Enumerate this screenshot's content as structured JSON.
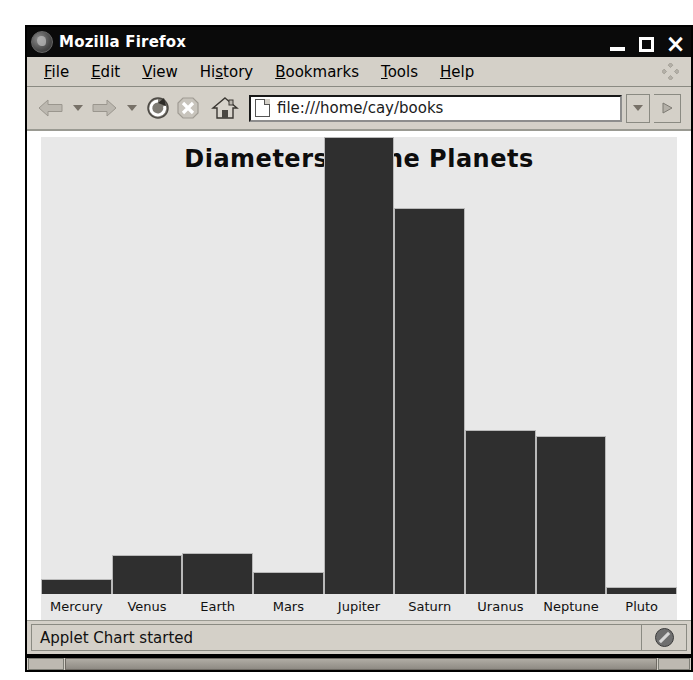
{
  "window": {
    "title": "Mozilla Firefox",
    "logo_icon": "firefox-logo-icon",
    "controls": {
      "minimize_label": "_",
      "maximize_label": "□",
      "close_label": "×"
    }
  },
  "menubar": {
    "items": [
      {
        "name": "file",
        "pre": "",
        "mnemonic": "F",
        "post": "ile"
      },
      {
        "name": "edit",
        "pre": "",
        "mnemonic": "E",
        "post": "dit"
      },
      {
        "name": "view",
        "pre": "",
        "mnemonic": "V",
        "post": "iew"
      },
      {
        "name": "history",
        "pre": "Hi",
        "mnemonic": "s",
        "post": "tory"
      },
      {
        "name": "bookmarks",
        "pre": "",
        "mnemonic": "B",
        "post": "ookmarks"
      },
      {
        "name": "tools",
        "pre": "",
        "mnemonic": "T",
        "post": "ools"
      },
      {
        "name": "help",
        "pre": "",
        "mnemonic": "H",
        "post": "elp"
      }
    ],
    "throbber_icon": "throbber-icon"
  },
  "toolbar": {
    "back_icon": "back-arrow-icon",
    "forward_icon": "forward-arrow-icon",
    "reload_icon": "reload-icon",
    "stop_icon": "stop-icon",
    "home_icon": "home-icon",
    "page_icon": "page-document-icon",
    "url_value": "file:///home/cay/books",
    "url_placeholder": "",
    "dropdown_icon": "chevron-down-icon",
    "go_icon": "go-arrow-icon"
  },
  "statusbar": {
    "message": "Applet Chart started",
    "security_icon": "security-slash-icon"
  },
  "colors": {
    "title_bar": "#0a0a0a",
    "chrome": "#d4d0c8",
    "chart_background": "#e8e8e8",
    "bar_fill": "#2f2f2f",
    "bar_border": "#b9b9b9",
    "text": "#111111"
  },
  "chart_data": {
    "type": "bar",
    "title": "Diameters of the Planets",
    "xlabel": "",
    "ylabel": "",
    "grid": false,
    "legend": "none",
    "unit": "km",
    "categories": [
      "Mercury",
      "Venus",
      "Earth",
      "Mars",
      "Jupiter",
      "Saturn",
      "Uranus",
      "Neptune",
      "Pluto"
    ],
    "values": [
      4800,
      12100,
      12800,
      6800,
      142800,
      120700,
      51100,
      49500,
      2300
    ],
    "ylim": [
      0,
      142800
    ]
  }
}
